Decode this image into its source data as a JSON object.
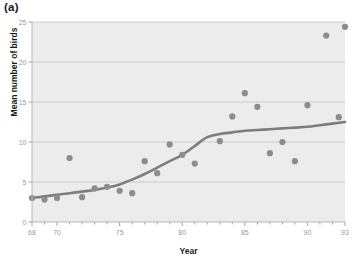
{
  "figure": {
    "panel_label": "(a)",
    "background_color": "#ffffff"
  },
  "chart_data": {
    "type": "scatter",
    "title": "",
    "xlabel": "Year",
    "ylabel": "Mean number of birds",
    "xlim": [
      68,
      93
    ],
    "ylim": [
      0,
      25
    ],
    "xticks": [
      68,
      70,
      75,
      80,
      85,
      90,
      93
    ],
    "xtick_labels": [
      "68",
      "70",
      "75",
      "80",
      "85",
      "90",
      "93"
    ],
    "minor_xtick_step": 1,
    "yticks": [
      0,
      5,
      10,
      15,
      20,
      25
    ],
    "ytick_labels": [
      "0",
      "5",
      "10",
      "15",
      "20",
      "25"
    ],
    "grid": "horizontal",
    "grid_color": "#c8c8c8",
    "plot_background": "#ececec",
    "legend": "none",
    "marker_color": "#8c8c8c",
    "marker_size": 5,
    "line_color": "#7d7d7d",
    "line_width": 2.6,
    "x": [
      68,
      69,
      70,
      71,
      72,
      73,
      74,
      75,
      76,
      77,
      78,
      79,
      80,
      81,
      83,
      84,
      85,
      86,
      87,
      88,
      89,
      90,
      91.5,
      92.5,
      93
    ],
    "y": [
      3.0,
      2.8,
      3.0,
      8.0,
      3.1,
      4.2,
      4.4,
      3.9,
      3.6,
      7.6,
      6.1,
      9.7,
      8.4,
      7.3,
      10.1,
      13.2,
      16.1,
      14.4,
      8.6,
      10.0,
      7.6,
      14.6,
      23.3,
      13.1,
      24.4
    ],
    "series": [
      {
        "name": "Mean number of birds",
        "kind": "points",
        "values": [
          3.0,
          2.8,
          3.0,
          8.0,
          3.1,
          4.2,
          4.4,
          3.9,
          3.6,
          7.6,
          6.1,
          9.7,
          8.4,
          7.3,
          10.1,
          13.2,
          16.1,
          14.4,
          8.6,
          10.0,
          7.6,
          14.6,
          23.3,
          13.1,
          24.4
        ]
      },
      {
        "name": "smoothed trend",
        "kind": "line",
        "x": [
          68,
          69,
          70,
          71,
          72,
          73,
          74,
          75,
          76,
          77,
          78,
          79,
          80,
          81,
          82,
          83,
          84,
          85,
          86,
          87,
          88,
          89,
          90,
          91,
          92,
          93
        ],
        "values": [
          3.0,
          3.2,
          3.4,
          3.6,
          3.8,
          4.0,
          4.3,
          4.7,
          5.3,
          6.0,
          6.8,
          7.6,
          8.4,
          9.5,
          10.6,
          11.0,
          11.2,
          11.4,
          11.5,
          11.6,
          11.7,
          11.8,
          11.9,
          12.1,
          12.3,
          12.5
        ]
      }
    ]
  }
}
